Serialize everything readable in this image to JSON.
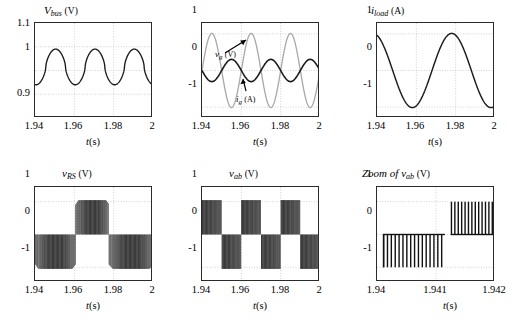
{
  "figure": {
    "background": "#ffffff",
    "curve_color": "#1a1a1a",
    "secondary_curve_color": "#a8a8a8",
    "grid_color": "#bfbfbf",
    "axis_color": "#2b2b2b"
  },
  "panels": [
    {
      "id": "vbus",
      "title_main": "V",
      "title_sub": "bus",
      "title_unit": "(V)",
      "xlabel_var": "t",
      "xlabel_unit": "(s)",
      "xticks": [
        "1.94",
        "1.96",
        "1.98",
        "2"
      ],
      "yticks": [
        "1.1",
        "1",
        "0.9"
      ]
    },
    {
      "id": "vg-ig",
      "title_main": "",
      "title_sub": "",
      "title_unit": "",
      "xlabel_var": "t",
      "xlabel_unit": "(s)",
      "xticks": [
        "1.94",
        "1.96",
        "1.98",
        "2"
      ],
      "yticks": [
        "1",
        "0",
        "-1"
      ],
      "annotations": [
        {
          "label_main": "v",
          "label_sub": "g",
          "label_unit": "(V)"
        },
        {
          "label_main": "i",
          "label_sub": "g",
          "label_unit": "(A)"
        }
      ]
    },
    {
      "id": "iload",
      "title_main": "i",
      "title_sub": "load",
      "title_unit": "(A)",
      "xlabel_var": "t",
      "xlabel_unit": "(s)",
      "xticks": [
        "1.94",
        "1.96",
        "1.98",
        "2"
      ],
      "yticks": [
        "1",
        "0",
        "-1"
      ]
    },
    {
      "id": "vrs",
      "title_main": "v",
      "title_sub": "RS",
      "title_unit": "(V)",
      "xlabel_var": "t",
      "xlabel_unit": "(s)",
      "xticks": [
        "1.94",
        "1.96",
        "1.98",
        "2"
      ],
      "yticks": [
        "1",
        "0",
        "-1"
      ]
    },
    {
      "id": "vab",
      "title_main": "v",
      "title_sub": "ab",
      "title_unit": "(V)",
      "xlabel_var": "t",
      "xlabel_unit": "(s)",
      "xticks": [
        "1.94",
        "1.96",
        "1.98",
        "2"
      ],
      "yticks": [
        "1",
        "0",
        "-1"
      ]
    },
    {
      "id": "vab-zoom",
      "title_prefix": "Zoom of ",
      "title_main": "v",
      "title_sub": "ab",
      "title_unit": "(V)",
      "xlabel_var": "t",
      "xlabel_unit": "(s)",
      "xticks": [
        "1.94",
        "1.941",
        "1.942"
      ],
      "yticks": [
        "1",
        "0",
        "-1"
      ]
    }
  ],
  "chart_data": [
    {
      "type": "line",
      "id": "vbus",
      "title": "V_bus (V)",
      "xlabel": "t(s)",
      "ylabel": "V_bus (V)",
      "xlim": [
        1.94,
        2.0
      ],
      "ylim": [
        0.88,
        1.12
      ],
      "xticks": [
        1.94,
        1.96,
        1.98,
        2.0
      ],
      "yticks": [
        1.1,
        1.0,
        0.9
      ],
      "grid": true,
      "legend": "none",
      "series": [
        {
          "name": "V_bus",
          "color": "#1a1a1a",
          "description": "DC bus voltage ripple: ~3 periods over 0.06 s (ripple freq 50 Hz), peaks ~1.055, troughs ~0.963, mean ~1.0, sharper peaks than troughs",
          "ripple_periods": 3,
          "peak": 1.055,
          "trough": 0.963,
          "mean": 1.0,
          "peak_phase_offset": 0.0105
        }
      ]
    },
    {
      "type": "line",
      "id": "vg-ig",
      "title": "",
      "xlabel": "t(s)",
      "ylabel": "",
      "xlim": [
        1.94,
        2.0
      ],
      "ylim": [
        -1.28,
        1.28
      ],
      "xticks": [
        1.94,
        1.96,
        1.98,
        2.0
      ],
      "yticks": [
        1,
        0,
        -1
      ],
      "grid": true,
      "legend": "inline-annotation",
      "series": [
        {
          "name": "v_g (V)",
          "color": "#a8a8a8",
          "description": "Grid voltage, amplitude 1.0, 3 full cycles over 0.06 s (50 Hz), starts near 0 rising",
          "amplitude": 1.0,
          "periods": 3,
          "phase_deg": 0
        },
        {
          "name": "i_g (A)",
          "color": "#1a1a1a",
          "description": "Grid current, amplitude ~0.3, 3 full cycles over 0.06 s, roughly in antiphase with v_g",
          "amplitude": 0.3,
          "periods": 3,
          "phase_deg": 180
        }
      ]
    },
    {
      "type": "line",
      "id": "iload",
      "title": "i_load (A)",
      "xlabel": "t(s)",
      "ylabel": "i_load (A)",
      "xlim": [
        1.94,
        2.0
      ],
      "ylim": [
        -1.28,
        1.28
      ],
      "xticks": [
        1.94,
        1.96,
        1.98,
        2.0
      ],
      "yticks": [
        1,
        0,
        -1
      ],
      "grid": true,
      "legend": "none",
      "series": [
        {
          "name": "i_load",
          "color": "#1a1a1a",
          "description": "Load current, amplitude 1.0, ~1.5 cycles over 0.06 s (25 Hz), starts at ~+0.95 falling, minimum -1 near t=1.9575, maximum +1 near t=1.9775",
          "amplitude": 1.0,
          "periods": 1.5,
          "start_value": 0.95
        }
      ]
    },
    {
      "type": "line",
      "id": "vrs",
      "title": "v_RS (V)",
      "xlabel": "t(s)",
      "ylabel": "v_RS (V)",
      "xlim": [
        1.94,
        2.0
      ],
      "ylim": [
        -1.45,
        1.45
      ],
      "xticks": [
        1.94,
        1.96,
        1.98,
        2.0
      ],
      "yticks": [
        1,
        0,
        -1
      ],
      "grid": true,
      "legend": "none",
      "series": [
        {
          "name": "v_RS",
          "color": "#1a1a1a",
          "description": "Matrix-converter PWM output voltage; dense switching between 0 and -1 for t in [1.940,1.9605], between 0 and +1 for t in [1.9605,1.9775], between 0 and -1 for t in [1.9775,2.0]; the envelope of each block bulges slightly (|env| up to ~1.06)",
          "switching_freq_hz": 5000,
          "envelope_amplitude": 1.05,
          "blocks": [
            {
              "t_start": 1.94,
              "t_end": 1.9605,
              "polarity": -1
            },
            {
              "t_start": 1.9605,
              "t_end": 1.9775,
              "polarity": 1
            },
            {
              "t_start": 1.9775,
              "t_end": 2.0,
              "polarity": -1
            }
          ]
        }
      ]
    },
    {
      "type": "line",
      "id": "vab",
      "title": "v_ab (V)",
      "xlabel": "t(s)",
      "ylabel": "v_ab (V)",
      "xlim": [
        1.94,
        2.0
      ],
      "ylim": [
        -1.45,
        1.45
      ],
      "xticks": [
        1.94,
        1.96,
        1.98,
        2.0
      ],
      "yticks": [
        1,
        0,
        -1
      ],
      "grid": true,
      "legend": "none",
      "series": [
        {
          "name": "v_ab",
          "color": "#1a1a1a",
          "description": "PWM output voltage alternating each half-cycle of 50 Hz: positive block (0..+1) then negative block (0..-1), 3 full alternations over 0.06 s, envelope sags slightly within each block",
          "switching_freq_hz": 5000,
          "envelope_amplitude": 1.05,
          "alternation_periods": 3,
          "first_polarity": 1
        }
      ]
    },
    {
      "type": "line",
      "id": "vab-zoom",
      "title": "Zoom of v_ab (V)",
      "xlabel": "t(s)",
      "ylabel": "v_ab (V)",
      "xlim": [
        1.94,
        1.942
      ],
      "ylim": [
        -1.45,
        1.45
      ],
      "xticks": [
        1.94,
        1.941,
        1.942
      ],
      "yticks": [
        1,
        0,
        -1
      ],
      "grid": true,
      "legend": "none",
      "series": [
        {
          "name": "v_ab (zoom)",
          "color": "#1a1a1a",
          "description": "Zoomed PWM pulse train: ~16 narrow negative pulses (0 to -1) from t=1.9401 to t=1.94115, then ~13 narrow positive pulses (0 to +1) from t=1.94125 to t=1.942; individual pulses resolved as thin bars",
          "pulse_count_negative": 16,
          "pulse_count_positive": 13,
          "transition_time": 1.94118,
          "pulse_amplitude": 1.0
        }
      ]
    }
  ]
}
